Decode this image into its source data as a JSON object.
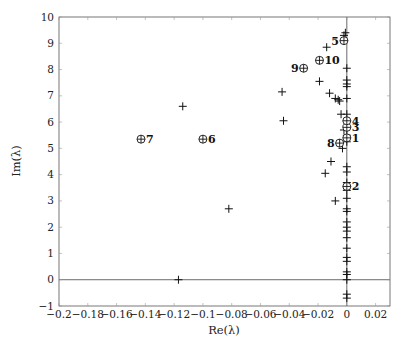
{
  "chart_data": {
    "type": "scatter",
    "title": "",
    "xlabel": "Re(λ)",
    "ylabel": "Im(λ)",
    "xlim": [
      -0.2,
      0.03
    ],
    "ylim": [
      -1,
      10
    ],
    "grid": false,
    "legend": null,
    "x_ticks": [
      -0.2,
      -0.18,
      -0.16,
      -0.14,
      -0.12,
      -0.1,
      -0.08,
      -0.06,
      -0.04,
      -0.02,
      0,
      0.02
    ],
    "x_tick_labels": [
      "−0.2",
      "−0.18",
      "−0.16",
      "−0.14",
      "−0.12",
      "−0.1",
      "−0.08",
      "−0.06",
      "−0.04",
      "−0.02",
      "0",
      "0.02"
    ],
    "y_ticks": [
      -1,
      0,
      1,
      2,
      3,
      4,
      5,
      6,
      7,
      8,
      9,
      10
    ],
    "y_tick_labels": [
      "−1",
      "0",
      "1",
      "2",
      "3",
      "4",
      "5",
      "6",
      "7",
      "8",
      "9",
      "10"
    ],
    "reference_lines": {
      "horizontal_at": 0,
      "vertical_at": 0
    },
    "series": [
      {
        "name": "eigenvalues",
        "marker": "plus",
        "points": [
          [
            -0.117,
            0.0
          ],
          [
            -0.082,
            2.7
          ],
          [
            -0.114,
            6.6
          ],
          [
            -0.045,
            7.15
          ],
          [
            -0.044,
            6.05
          ],
          [
            -0.019,
            7.55
          ],
          [
            -0.014,
            8.85
          ],
          [
            -0.012,
            7.1
          ],
          [
            -0.008,
            6.9
          ],
          [
            -0.006,
            6.85
          ],
          [
            -0.005,
            6.8
          ],
          [
            -0.004,
            6.3
          ],
          [
            -0.002,
            5.7
          ],
          [
            -0.003,
            5.0
          ],
          [
            -0.011,
            4.5
          ],
          [
            -0.015,
            4.05
          ],
          [
            -0.008,
            3.0
          ],
          [
            -0.002,
            9.3
          ],
          [
            -0.001,
            9.4
          ],
          [
            0,
            8.05
          ],
          [
            0,
            7.6
          ],
          [
            0,
            7.45
          ],
          [
            0,
            7.35
          ],
          [
            0,
            6.9
          ],
          [
            0,
            6.3
          ],
          [
            0,
            5.5
          ],
          [
            0,
            5.25
          ],
          [
            0,
            4.3
          ],
          [
            0,
            4.1
          ],
          [
            0,
            3.7
          ],
          [
            0,
            3.4
          ],
          [
            0,
            3.1
          ],
          [
            0,
            2.7
          ],
          [
            0,
            2.6
          ],
          [
            0,
            2.2
          ],
          [
            0,
            2.0
          ],
          [
            0,
            1.85
          ],
          [
            0,
            1.6
          ],
          [
            0,
            1.2
          ],
          [
            0,
            0.85
          ],
          [
            0,
            0.7
          ],
          [
            0,
            0.3
          ],
          [
            0,
            0.2
          ],
          [
            0,
            0.0
          ],
          [
            0,
            -0.55
          ],
          [
            0,
            -0.7
          ]
        ]
      },
      {
        "name": "labeled eigenvalues",
        "marker": "circled-plus",
        "points": [
          {
            "label": "1",
            "x": 0.0,
            "y": 5.4
          },
          {
            "label": "2",
            "x": 0.0,
            "y": 3.55
          },
          {
            "label": "3",
            "x": 0.0,
            "y": 5.8
          },
          {
            "label": "4",
            "x": 0.0,
            "y": 6.05
          },
          {
            "label": "5",
            "x": -0.002,
            "y": 9.1
          },
          {
            "label": "6",
            "x": -0.1,
            "y": 5.35
          },
          {
            "label": "7",
            "x": -0.143,
            "y": 5.35
          },
          {
            "label": "8",
            "x": -0.005,
            "y": 5.2
          },
          {
            "label": "9",
            "x": -0.03,
            "y": 8.05
          },
          {
            "label": "10",
            "x": -0.019,
            "y": 8.35
          }
        ]
      }
    ]
  },
  "label_positions": {
    "1": "right",
    "2": "right",
    "3": "right",
    "4": "right",
    "5": "left",
    "6": "right",
    "7": "right",
    "8": "left",
    "9": "left",
    "10": "right"
  }
}
